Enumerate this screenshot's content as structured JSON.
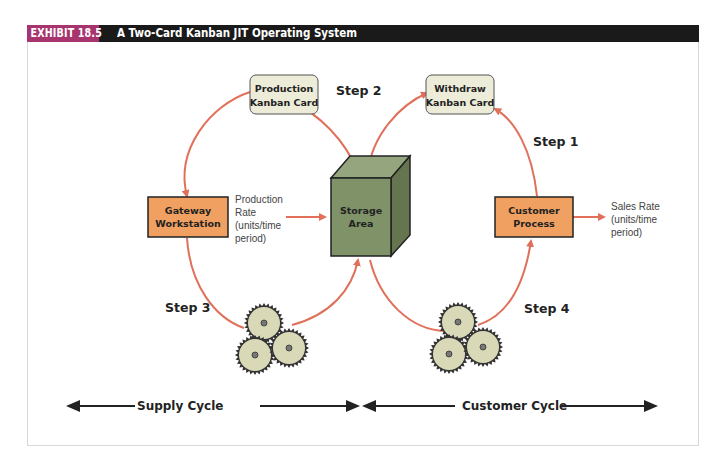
{
  "header": {
    "exhibit_tag": "EXHIBIT 18.5",
    "title": "A Two-Card Kanban JIT Operating System",
    "tag_color": "#a8346e",
    "bar_color": "#1a1a1a"
  },
  "cards": {
    "production": [
      "Production",
      "Kanban Card"
    ],
    "withdraw": [
      "Withdraw",
      "Kanban Card"
    ]
  },
  "steps": {
    "step1": "Step 1",
    "step2": "Step 2",
    "step3": "Step 3",
    "step4": "Step 4"
  },
  "nodes": {
    "gateway": [
      "Gateway",
      "Workstation"
    ],
    "storage": [
      "Storage",
      "Area"
    ],
    "customer": [
      "Customer",
      "Process"
    ]
  },
  "rates": {
    "production": [
      "Production",
      "Rate",
      "(units/time",
      "period)"
    ],
    "sales": [
      "Sales Rate",
      "(units/time",
      "period)"
    ]
  },
  "cycles": {
    "supply": "Supply Cycle",
    "customer": "Customer Cycle"
  },
  "colors": {
    "arrow": "#e0705a",
    "process_box": "#f0a060",
    "card_fill": "#ececd8",
    "cube_front": "#7f9268",
    "cube_top": "#95a57e",
    "cube_side": "#65754f",
    "gear": "#d9d9b8"
  }
}
